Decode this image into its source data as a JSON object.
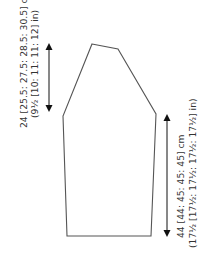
{
  "diagram": {
    "type": "knitting schematic",
    "shape": "sleeve",
    "colors": {
      "outline": "#555555",
      "arrow": "#111111",
      "text": "#333333"
    },
    "outline_points": [
      [
        92,
        44
      ],
      [
        118,
        49
      ],
      [
        156,
        114
      ],
      [
        151,
        236
      ],
      [
        67,
        236
      ],
      [
        63,
        116
      ]
    ],
    "measurements": {
      "cap_height": {
        "cm": "24 [25.5: 27.5: 28.5: 30.5] cm",
        "in": "(9½ [10: 11: 11: 12] in)"
      },
      "sleeve_length": {
        "cm": "44 [44: 45: 45: 45] cm",
        "in": "(17½ [17½: 17½: 17½: 17½] in)"
      }
    }
  }
}
